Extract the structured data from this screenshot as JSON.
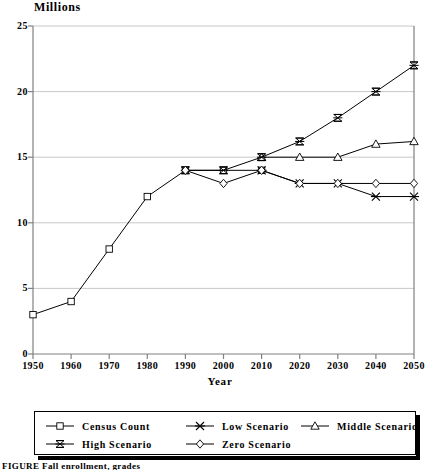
{
  "chart_data": {
    "type": "line",
    "title": "",
    "ylabel": "Millions",
    "xlabel": "Year",
    "x": [
      1950,
      1960,
      1970,
      1980,
      1990,
      2000,
      2010,
      2020,
      2030,
      2040,
      2050
    ],
    "xtick_labels": [
      "1950",
      "1960",
      "1970",
      "1980",
      "1990",
      "2000",
      "2010",
      "2020",
      "2030",
      "2040",
      "2050"
    ],
    "ytick_labels": [
      "0",
      "5",
      "10",
      "15",
      "20",
      "25"
    ],
    "ytick_values": [
      0,
      5,
      10,
      15,
      20,
      25
    ],
    "ylim": [
      0,
      25
    ],
    "xlim": [
      1950,
      2050
    ],
    "grid": true,
    "legend_position": "below-axes",
    "series": [
      {
        "name": "Census Count",
        "marker": "square",
        "x": [
          1950,
          1960,
          1970,
          1980,
          1990,
          2000,
          2010
        ],
        "values": [
          3,
          4,
          8,
          12,
          14,
          14,
          14
        ]
      },
      {
        "name": "Low Scenario",
        "marker": "x-cross",
        "x": [
          2010,
          2020,
          2030,
          2040,
          2050
        ],
        "values": [
          14,
          13,
          13,
          12,
          12
        ]
      },
      {
        "name": "Middle Scenario",
        "marker": "triangle",
        "x": [
          2010,
          2020,
          2030,
          2040,
          2050
        ],
        "values": [
          15,
          15,
          15,
          16,
          16.2
        ]
      },
      {
        "name": "High Scenario",
        "marker": "star-box",
        "x": [
          1990,
          2000,
          2010,
          2020,
          2030,
          2040,
          2050
        ],
        "values": [
          14,
          14,
          15,
          16.2,
          18,
          20,
          22
        ]
      },
      {
        "name": "Zero Scenario",
        "marker": "diamond",
        "x": [
          1990,
          2000,
          2010,
          2020,
          2030,
          2040,
          2050
        ],
        "values": [
          14,
          13,
          14,
          13,
          13,
          13,
          13
        ]
      }
    ]
  },
  "legend": {
    "rows": [
      [
        {
          "label": "Census Count",
          "marker": "square"
        },
        {
          "label": "Low Scenario",
          "marker": "x-cross"
        },
        {
          "label": "Middle Scenario",
          "marker": "triangle"
        }
      ],
      [
        {
          "label": "High Scenario",
          "marker": "star-box"
        },
        {
          "label": "Zero Scenario",
          "marker": "diamond"
        }
      ]
    ]
  },
  "caption": {
    "text": "FIGURE        Fall enrollment, grades"
  },
  "colors": {
    "line": "#000000",
    "grid": "#c8c8c8",
    "axis": "#808080",
    "text": "#000000",
    "background": "#ffffff"
  }
}
